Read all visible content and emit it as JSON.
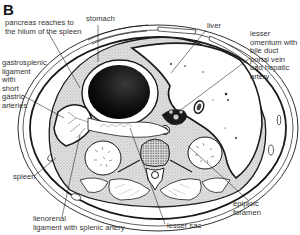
{
  "figure": {
    "letter": "B",
    "type": "transverse abdominal cross-section"
  },
  "labels": {
    "pancreas": "pancreas reaches to\nthe hilum of the spleen",
    "stomach": "stomach",
    "liver": "liver",
    "lesser_omentum": "lesser\nomentum with\nbile duct\nportal vein\nand hepatic\nartery",
    "gastrosplenic": "gastrosplenic\nligament\nwith\nshort\ngastric\narteries",
    "spleen": "spleen",
    "lienorenal": "lienorenal\nligament with splenic artery",
    "lesser_sac": "lesser sac",
    "epiploic": "epiploic\nforamen"
  },
  "colors": {
    "line": "#1a1a1a",
    "stipple": "#c9c9c9",
    "stomach_dark": "#111111",
    "background": "#ffffff"
  }
}
